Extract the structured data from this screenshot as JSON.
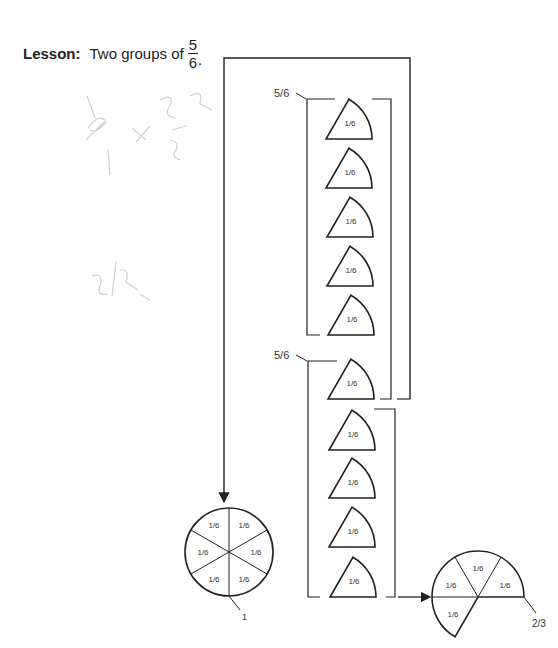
{
  "lesson": {
    "label": "Lesson:",
    "text": "Two groups of",
    "fraction_numerator": "5",
    "fraction_denominator": "6",
    "period": "."
  },
  "groups": [
    {
      "label": "5/6",
      "pieces": [
        "1/6",
        "1/6",
        "1/6",
        "1/6",
        "1/6"
      ]
    },
    {
      "label": "5/6",
      "pieces": [
        "1/6",
        "1/6",
        "1/6",
        "1/6",
        "1/6"
      ]
    }
  ],
  "whole_circle": {
    "label": "1",
    "sectors": [
      "1/6",
      "1/6",
      "1/6",
      "1/6",
      "1/6",
      "1/6"
    ]
  },
  "result_circle": {
    "label": "2/3",
    "sectors": [
      "1/6",
      "1/6",
      "1/6",
      "1/6"
    ]
  },
  "colors": {
    "ink": "#222222",
    "pencil": "#cfcfcf"
  }
}
